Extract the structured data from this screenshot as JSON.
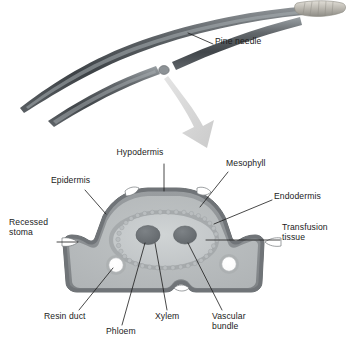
{
  "figure": {
    "background_color": "#ffffff"
  },
  "specimen": {
    "name": "pine-needles",
    "needle_count": 2,
    "needle_color_dark": "#3f4347",
    "needle_color_mid": "#6b7075",
    "needle_color_light": "#9aa0a4",
    "sheath_color": "#c9c6bf",
    "cut_end_color": "#8d9296"
  },
  "arrow": {
    "name": "zoom-arrow",
    "color": "#d6d6d6",
    "direction": "down-right"
  },
  "cross_section": {
    "name": "needle-cross-section",
    "colors": {
      "epidermis": "#8b8f92",
      "hypodermis": "#75797d",
      "mesophyll": "#b8bcbd",
      "mesophyll_inner": "#aeb2b4",
      "endodermis_ring": "#9ea2a4",
      "transfusion_tissue": "#c6cacb",
      "vascular_bundle": "#6e7376",
      "resin_duct_fill": "#ffffff",
      "resin_duct_ring": "#a7abad",
      "stoma_fill": "#ffffff",
      "outline": "#6a6e71"
    },
    "features": {
      "stoma_count": 4,
      "resin_duct_count": 2,
      "vascular_bundle_count": 2
    }
  },
  "labels": [
    {
      "id": "pine-needle",
      "text": "Pine needle",
      "align": "left",
      "x": 215,
      "y": 42
    },
    {
      "id": "hypodermis",
      "text": "Hypodermis",
      "align": "center",
      "x": 140,
      "y": 152
    },
    {
      "id": "mesophyll",
      "text": "Mesophyll",
      "align": "left",
      "x": 226,
      "y": 163
    },
    {
      "id": "epidermis",
      "text": "Epidermis",
      "align": "left",
      "x": 51,
      "y": 180
    },
    {
      "id": "endodermis",
      "text": "Endodermis",
      "align": "left",
      "x": 274,
      "y": 196
    },
    {
      "id": "recessed-stoma",
      "text": "Recessed\nstoma",
      "align": "left",
      "x": 9,
      "y": 222
    },
    {
      "id": "transfusion-tissue",
      "text": "Transfusion\ntissue",
      "align": "left",
      "x": 282,
      "y": 227
    },
    {
      "id": "resin-duct",
      "text": "Resin duct",
      "align": "left",
      "x": 44,
      "y": 315
    },
    {
      "id": "phloem",
      "text": "Phloem",
      "align": "left",
      "x": 106,
      "y": 330
    },
    {
      "id": "xylem",
      "text": "Xylem",
      "align": "left",
      "x": 155,
      "y": 315
    },
    {
      "id": "vascular-bundle",
      "text": "Vascular\nbundle",
      "align": "left",
      "x": 212,
      "y": 315
    }
  ],
  "leader_lines": {
    "name": "label-leader-lines",
    "color": "#1b1b1b",
    "width": 0.8,
    "count": 11
  }
}
